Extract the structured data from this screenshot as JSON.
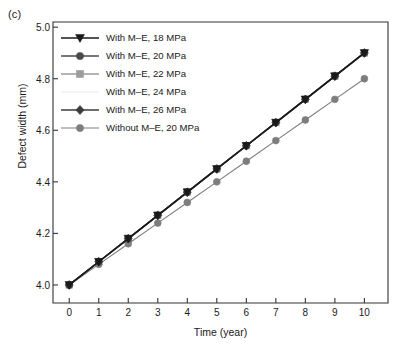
{
  "panel_label": "(c)",
  "chart_data": {
    "type": "line",
    "title": "",
    "panel": "(c)",
    "xlabel": "Time (year)",
    "ylabel": "Defect width (mm)",
    "x": [
      0,
      1,
      2,
      3,
      4,
      5,
      6,
      7,
      8,
      9,
      10
    ],
    "xlim": [
      -0.55,
      10.8
    ],
    "ylim": [
      3.93,
      5.02
    ],
    "xticks": [
      "0",
      "1",
      "2",
      "3",
      "4",
      "5",
      "6",
      "7",
      "8",
      "9",
      "10"
    ],
    "yticks": [
      "4.0",
      "4.2",
      "4.4",
      "4.6",
      "4.8",
      "5.0"
    ],
    "ytick_values": [
      4.0,
      4.2,
      4.4,
      4.6,
      4.8,
      5.0
    ],
    "grid": false,
    "legend_position": "upper left",
    "series": [
      {
        "name": "With M–E, 18 MPa",
        "marker": "triangle-down",
        "color": "#1a1a1a",
        "values": [
          4.0,
          4.09,
          4.18,
          4.27,
          4.36,
          4.45,
          4.54,
          4.63,
          4.72,
          4.81,
          4.9
        ]
      },
      {
        "name": "With M–E, 20 MPa",
        "marker": "circle",
        "color": "#4a4a4a",
        "values": [
          4.0,
          4.09,
          4.18,
          4.27,
          4.36,
          4.45,
          4.54,
          4.63,
          4.72,
          4.81,
          4.9
        ]
      },
      {
        "name": "With M–E, 22 MPa",
        "marker": "square",
        "color": "#9b9b9b",
        "values": [
          4.0,
          4.09,
          4.18,
          4.27,
          4.36,
          4.45,
          4.54,
          4.63,
          4.72,
          4.81,
          4.9
        ]
      },
      {
        "name": "With M–E, 24 MPa",
        "marker": "none",
        "color": "#f2f2f2",
        "values": [
          4.0,
          4.09,
          4.18,
          4.27,
          4.36,
          4.45,
          4.54,
          4.63,
          4.72,
          4.81,
          4.9
        ]
      },
      {
        "name": "With M–E, 26 MPa",
        "marker": "diamond",
        "color": "#3d3d3d",
        "values": [
          4.0,
          4.09,
          4.18,
          4.27,
          4.36,
          4.45,
          4.54,
          4.63,
          4.72,
          4.81,
          4.9
        ]
      },
      {
        "name": "Without M–E, 20 MPa",
        "marker": "circle",
        "color": "#7d7d7d",
        "values": [
          4.0,
          4.08,
          4.16,
          4.24,
          4.32,
          4.4,
          4.48,
          4.56,
          4.64,
          4.72,
          4.8
        ]
      }
    ]
  },
  "axes": {
    "frame_color": "#333333"
  }
}
